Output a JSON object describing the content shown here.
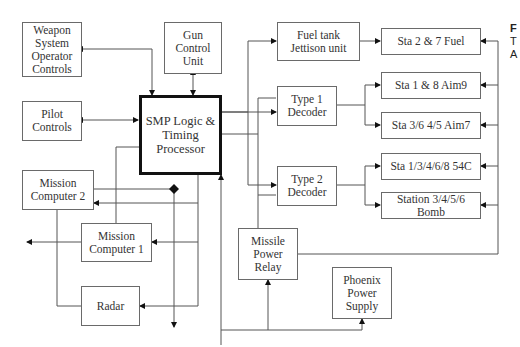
{
  "diagram": {
    "nodes": {
      "wso_controls": "Weapon System Operator Controls",
      "gun_control_unit": "Gun Control Unit",
      "pilot_controls": "Pilot Controls",
      "smp": "SMP Logic & Timing Processor",
      "mission_computer_2": "Mission Computer 2",
      "mission_computer_1": "Mission Computer 1",
      "radar": "Radar",
      "fuel_jettison": "Fuel tank Jettison unit",
      "type1_decoder": "Type 1 Decoder",
      "type2_decoder": "Type 2 Decoder",
      "missile_power_relay": "Missile Power Relay",
      "phoenix_power_supply": "Phoenix Power Supply",
      "sta_fuel": "Sta 2 & 7 Fuel",
      "sta_aim9": "Sta 1 & 8 Aim9",
      "sta_aim7": "Sta 3/6 4/5 Aim7",
      "sta_54c": "Sta 1/3/4/6/8 54C",
      "sta_bomb": "Station 3/4/5/6 Bomb"
    },
    "side_text": [
      "F",
      "T",
      "A"
    ]
  }
}
